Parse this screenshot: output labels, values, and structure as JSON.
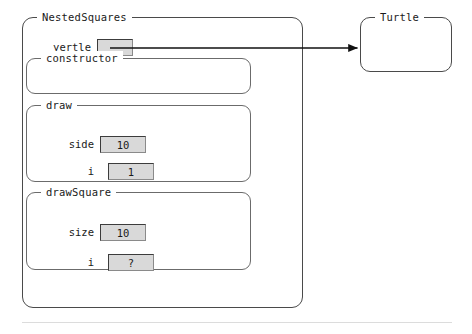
{
  "diagram": {
    "type": "object-stack-diagram",
    "background_color": "#ffffff",
    "frames": {
      "outer": {
        "label": "NestedSquares",
        "variables": [
          {
            "name": "yertle",
            "value": "",
            "is_reference": true
          }
        ]
      },
      "constructor": {
        "label": "constructor",
        "variables": []
      },
      "draw": {
        "label": "draw",
        "variables": [
          {
            "name": "side",
            "value": "10"
          },
          {
            "name": "i",
            "value": "1"
          }
        ]
      },
      "drawSquare": {
        "label": "drawSquare",
        "variables": [
          {
            "name": "size",
            "value": "10"
          },
          {
            "name": "i",
            "value": "?"
          }
        ]
      },
      "object": {
        "label": "Turtle",
        "variables": []
      }
    },
    "arrow": {
      "name": "yertle-reference-arrow",
      "from": "yertle",
      "to": "Turtle",
      "color": "#111111"
    },
    "colors": {
      "frame_border": "#5a5a5a",
      "value_box_fill": "#d9d9d9",
      "value_box_border": "#3c3c3c",
      "text": "#1a1a1a",
      "rule": "#dcdcdc"
    }
  }
}
